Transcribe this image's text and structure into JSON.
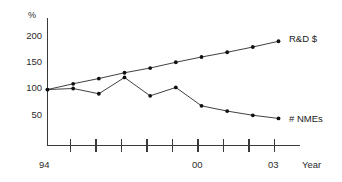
{
  "chart_data": {
    "type": "line",
    "title": "",
    "subtitle": "",
    "xlabel": "Year",
    "ylabel": "%",
    "ylim": [
      0,
      215
    ],
    "xlim": [
      1994,
      2003
    ],
    "grid": false,
    "legend_position": "right-inline",
    "y_ticks": [
      50,
      100,
      150,
      200
    ],
    "y_tick_labels": [
      "50",
      "100",
      "150",
      "200"
    ],
    "x_ticks": [
      1994,
      1995,
      1996,
      1997,
      1998,
      1999,
      2000,
      2001,
      2002,
      2003
    ],
    "x_tick_labels": [
      "94",
      "",
      "",
      "",
      "",
      "",
      "00",
      "",
      "",
      "03"
    ],
    "x_visible_tick_labels": [
      "94",
      "00",
      "03"
    ],
    "x": [
      1994,
      1995,
      1996,
      1997,
      1998,
      1999,
      2000,
      2001,
      2002,
      2003
    ],
    "series": [
      {
        "name": "R&D $",
        "values": [
          98,
          109,
          119,
          130,
          139,
          150,
          160,
          169,
          179,
          190
        ],
        "color": "#2b2b2b",
        "marker": "filled-circle"
      },
      {
        "name": "# NMEs",
        "values": [
          98,
          100,
          90,
          121,
          86,
          102,
          67,
          57,
          49,
          43
        ],
        "color": "#2b2b2b",
        "marker": "filled-circle"
      }
    ],
    "annotations": [
      {
        "text": "R&D $",
        "attached_to": "R&D $",
        "position": "end-right"
      },
      {
        "text": "# NMEs",
        "attached_to": "# NMEs",
        "position": "end-right"
      }
    ]
  },
  "axes": {
    "y_unit_label": "%",
    "x_axis_name": "Year",
    "y_tick_labels": [
      "200",
      "150",
      "100",
      "50"
    ],
    "x_tick_labels": [
      "94",
      "00",
      "03"
    ]
  },
  "series_labels": {
    "rd": "R&D $",
    "nme": "# NMEs"
  }
}
